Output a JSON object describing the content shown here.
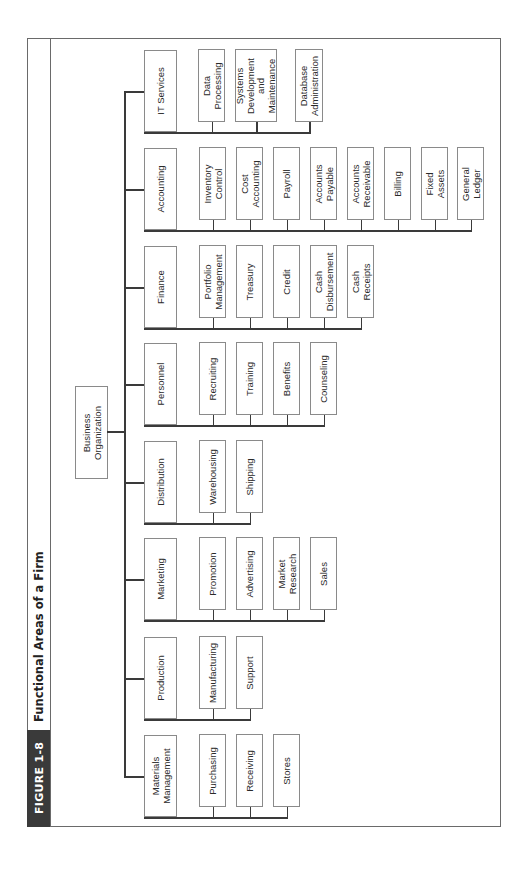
{
  "figure": {
    "number_label": "FIGURE 1-8",
    "title": "Functional Areas of a Firm"
  },
  "root": {
    "label": "Business\nOrganization"
  },
  "departments": [
    {
      "label": "IT Services",
      "children": [
        "Data\nProcessing",
        "Systems\nDevelopment\nand\nMaintenance",
        "Database\nAdministration"
      ]
    },
    {
      "label": "Accounting",
      "children": [
        "Inventory\nControl",
        "Cost\nAccounting",
        "Payroll",
        "Accounts\nPayable",
        "Accounts\nReceivable",
        "Billing",
        "Fixed\nAssets",
        "General\nLedger"
      ]
    },
    {
      "label": "Finance",
      "children": [
        "Portfolio\nManagement",
        "Treasury",
        "Credit",
        "Cash\nDisbursement",
        "Cash\nReceipts"
      ]
    },
    {
      "label": "Personnel",
      "children": [
        "Recruiting",
        "Training",
        "Benefits",
        "Counseling"
      ]
    },
    {
      "label": "Distribution",
      "children": [
        "Warehousing",
        "Shipping"
      ]
    },
    {
      "label": "Marketing",
      "children": [
        "Promotion",
        "Advertising",
        "Market\nResearch",
        "Sales"
      ]
    },
    {
      "label": "Production",
      "children": [
        "Manufacturing",
        "Support"
      ]
    },
    {
      "label": "Materials\nManagement",
      "children": [
        "Purchasing",
        "Receiving",
        "Stores"
      ]
    }
  ]
}
